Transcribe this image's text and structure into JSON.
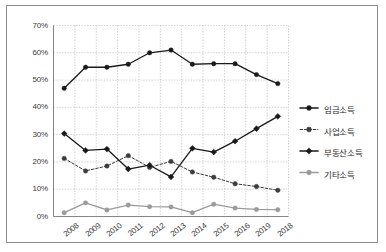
{
  "chart_data": {
    "type": "line",
    "title": "",
    "subtitle": "",
    "xlabel": "",
    "ylabel": "",
    "ylim": [
      0,
      70
    ],
    "yunit": "%",
    "grid": true,
    "legend_position": "right",
    "categories": [
      "2008",
      "2009",
      "2010",
      "2011",
      "2012",
      "2013",
      "2014",
      "2015",
      "2016",
      "2019",
      "2018"
    ],
    "ytick_labels": [
      "0%",
      "10%",
      "20%",
      "30%",
      "40%",
      "50%",
      "60%",
      "70%"
    ],
    "ytick_values": [
      0,
      10,
      20,
      30,
      40,
      50,
      60,
      70
    ],
    "series": [
      {
        "name": "임금소득",
        "style": "solid",
        "marker": "circle",
        "color": "#1a1a1a",
        "values": [
          47.0,
          54.7,
          54.7,
          55.8,
          60.0,
          61.0,
          55.8,
          56.0,
          56.0,
          52.0,
          48.7
        ]
      },
      {
        "name": "사업소득",
        "style": "dashed",
        "marker": "circle",
        "color": "#3d3d3d",
        "values": [
          21.3,
          16.7,
          18.5,
          22.3,
          18.0,
          20.2,
          16.3,
          14.4,
          12.0,
          11.0,
          9.6
        ]
      },
      {
        "name": "부동산소득",
        "style": "solid",
        "marker": "diamond",
        "color": "#1a1a1a",
        "values": [
          30.4,
          24.2,
          24.7,
          17.4,
          18.8,
          14.5,
          25.0,
          23.6,
          27.6,
          32.2,
          36.7
        ]
      },
      {
        "name": "기타소득",
        "style": "solid",
        "marker": "circle",
        "color": "#9a9a9a",
        "values": [
          1.4,
          5.0,
          2.4,
          4.2,
          3.6,
          3.5,
          1.4,
          4.5,
          3.1,
          2.6,
          2.5
        ]
      }
    ]
  },
  "colors": {
    "frame": "#8a8a8a",
    "grid": "#bdbdbd",
    "axis": "#7a7a7a",
    "text": "#3b3b3b",
    "series_dark": "#1a1a1a",
    "series_gray": "#9a9a9a"
  }
}
